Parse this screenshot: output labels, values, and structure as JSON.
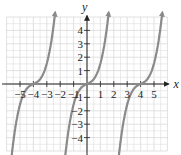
{
  "chart_data": {
    "type": "line",
    "title": "",
    "xlabel": "x",
    "ylabel": "y",
    "xlim": [
      -5.5,
      5.5
    ],
    "ylim": [
      -4.8,
      4.8
    ],
    "grid": true,
    "x_ticks": [
      -5,
      -4,
      -3,
      -2,
      -1,
      1,
      2,
      3,
      4,
      5
    ],
    "y_ticks": [
      -4,
      -3,
      -2,
      -1,
      1,
      2,
      3,
      4
    ],
    "x_tick_labels": [
      "−5",
      "−4",
      "−3",
      "−2",
      "−1",
      "1",
      "2",
      "3",
      "4",
      "5"
    ],
    "y_tick_labels": [
      "−4",
      "−3",
      "−2",
      "−1",
      "1",
      "2",
      "3",
      "4"
    ],
    "series": [
      {
        "name": "branch-left",
        "x_range": [
          -5.6,
          -2.4
        ],
        "center": -4
      },
      {
        "name": "branch-middle",
        "x_range": [
          -1.6,
          1.6
        ],
        "center": 0
      },
      {
        "name": "branch-right",
        "x_range": [
          2.4,
          5.6
        ],
        "center": 4
      }
    ],
    "curve_color": "#8a8a8a",
    "grid_color": "#d9d9d9",
    "axis_color": "#222222"
  }
}
